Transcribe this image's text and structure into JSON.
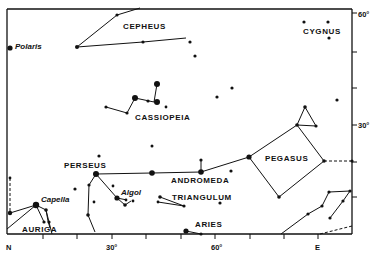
{
  "title": "",
  "chart_data": {
    "type": "scatter",
    "axes": {
      "right_axis": {
        "labels": [
          "60°",
          "30°"
        ],
        "ticks_deg": [
          60,
          50,
          40,
          30,
          20,
          10
        ]
      },
      "bottom_axis": {
        "labels": [
          "N",
          "30°",
          "60°",
          "E"
        ],
        "ticks_deg": [
          0,
          10,
          20,
          30,
          40,
          50,
          60,
          70,
          80,
          90
        ]
      }
    },
    "constellations": [
      {
        "name": "CEPHEUS"
      },
      {
        "name": "CYGNUS"
      },
      {
        "name": "CASSIOPEIA"
      },
      {
        "name": "PERSEUS"
      },
      {
        "name": "ANDROMEDA"
      },
      {
        "name": "PEGASUS"
      },
      {
        "name": "TRIANGULUM"
      },
      {
        "name": "ARIES"
      },
      {
        "name": "AURIGA"
      }
    ],
    "named_stars": [
      {
        "name": "Polaris"
      },
      {
        "name": "Capella"
      },
      {
        "name": "Algol"
      }
    ]
  },
  "labels": {
    "cepheus": "CEPHEUS",
    "cygnus": "CYGNUS",
    "cassiopeia": "CASSIOPEIA",
    "perseus": "PERSEUS",
    "andromeda": "ANDROMEDA",
    "pegasus": "PEGASUS",
    "triangulum": "TRIANGULUM",
    "aries": "ARIES",
    "auriga": "AURIGA",
    "polaris": "Polaris",
    "capella": "Capella",
    "algol": "Algol",
    "y60": "60°",
    "y30": "30°",
    "xN": "N",
    "x30": "30°",
    "x60": "60°",
    "xE": "E"
  }
}
